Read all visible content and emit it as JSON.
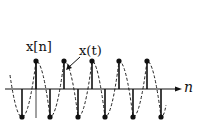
{
  "diagram": {
    "labels": {
      "discrete_signal": "x[n]",
      "continuous_signal": "x(t)",
      "axis_variable": "n"
    },
    "axis": {
      "y": 89,
      "x_start": 5,
      "x_end": 180
    },
    "vertical_axis": {
      "x": 36,
      "y_top": 58,
      "y_bottom": 118
    },
    "samples_up_x": [
      36,
      64,
      92,
      119,
      147
    ],
    "samples_down_x": [
      22,
      50,
      78,
      105,
      133,
      161
    ],
    "sample_top_y": 61,
    "sample_bottom_y": 117,
    "colors": {
      "ink": "#111111",
      "background": "#ffffff"
    }
  }
}
